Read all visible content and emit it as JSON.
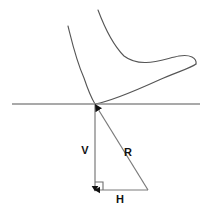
{
  "figure": {
    "background_color": "#ffffff",
    "width": 208,
    "height": 211
  },
  "colors": {
    "foot_outline": "#555555",
    "ground_line": "#8c8c8c",
    "vector_line": "#7a7a7a",
    "arrow_fill": "#111111",
    "label_text": "#111111"
  },
  "ground": {
    "name": "ground-line",
    "x1": 12,
    "y1": 104,
    "x2": 200,
    "y2": 104
  },
  "contact_point": {
    "x": 95,
    "y": 104
  },
  "labels": {
    "vertical": "V",
    "resultant": "R",
    "horizontal": "H"
  },
  "label_positions": {
    "vertical": {
      "x": 85,
      "y": 154
    },
    "resultant": {
      "x": 128,
      "y": 156
    },
    "horizontal": {
      "x": 120,
      "y": 202
    }
  },
  "vectors": [
    {
      "name": "vertical-force-vector",
      "label": "V",
      "from": {
        "x": 95,
        "y": 104
      },
      "to": {
        "x": 95,
        "y": 190
      },
      "arrow_at": "end",
      "direction": "down"
    },
    {
      "name": "horizontal-force-vector",
      "label": "H",
      "from": {
        "x": 148,
        "y": 190
      },
      "to": {
        "x": 95,
        "y": 190
      },
      "arrow_at": "end",
      "direction": "left"
    },
    {
      "name": "resultant-force-vector",
      "label": "R",
      "from": {
        "x": 148,
        "y": 190
      },
      "to": {
        "x": 95,
        "y": 104
      },
      "arrow_at": "end",
      "direction": "up-left"
    }
  ],
  "right_angle_marker": {
    "name": "right-angle-marker",
    "x": 95,
    "y": 190,
    "size": 8
  },
  "foot": {
    "name": "foot-outline",
    "description": "Side view outline of a foot resting on the ground, heel at left, toes at right",
    "upper_path": "M 68 26 C 72 42, 76 60, 84 78 C 88 90, 92 99, 95 104",
    "shin_path": "M 98 10 C 104 26, 112 44, 124 56 C 140 68, 162 60, 178 56 C 190 54, 196 58, 196 64",
    "sole_path": "M 95 104 C 110 100, 136 90, 158 80 C 176 72, 190 68, 196 64"
  }
}
